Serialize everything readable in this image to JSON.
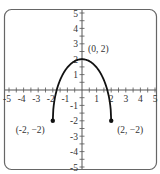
{
  "chart_data": {
    "type": "line",
    "title": "",
    "xlabel": "",
    "ylabel": "",
    "xlim": [
      -5,
      5
    ],
    "ylim": [
      -5,
      5
    ],
    "grid": false,
    "x_ticks": [
      -5,
      -4,
      -3,
      -2,
      -1,
      1,
      2,
      3,
      4,
      5
    ],
    "y_ticks": [
      -5,
      -4,
      -3,
      -2,
      -1,
      1,
      2,
      3,
      4,
      5
    ],
    "x_tick_labels": [
      "-5",
      "-4",
      "-3",
      "-2",
      "-1",
      "1",
      "2",
      "3",
      "4",
      "5"
    ],
    "y_tick_labels": [
      "-5",
      "-4",
      "-3",
      "-2",
      "-1",
      "1",
      "2",
      "3",
      "4",
      "5"
    ],
    "minor_tick_step": 0.5,
    "series": [
      {
        "name": "curve",
        "description": "Upper half of ellipse centered (0,-2), semi-axes 2 (x) and 4 (y); endpoints (-2,-2) and (2,-2) shown as closed dots",
        "x": [
          -2,
          -1.9,
          -1.75,
          -1.5,
          -1.25,
          -1,
          -0.75,
          -0.5,
          -0.25,
          0,
          0.25,
          0.5,
          0.75,
          1,
          1.25,
          1.5,
          1.75,
          1.9,
          2
        ],
        "y": [
          -2,
          -0.75,
          -0.06,
          0.65,
          1.12,
          1.46,
          1.71,
          1.87,
          1.97,
          2,
          1.97,
          1.87,
          1.71,
          1.46,
          1.12,
          0.65,
          -0.06,
          -0.75,
          -2
        ]
      }
    ],
    "points": [
      {
        "x": 0,
        "y": 2,
        "label": "(0, 2)",
        "marker": false
      },
      {
        "x": -2,
        "y": -2,
        "label": "(-2, −2)",
        "marker": true
      },
      {
        "x": 2,
        "y": -2,
        "label": "(2, −2)",
        "marker": true
      }
    ],
    "frame": {
      "rounded": true,
      "color": "#555555"
    },
    "line_color": "#111111"
  }
}
